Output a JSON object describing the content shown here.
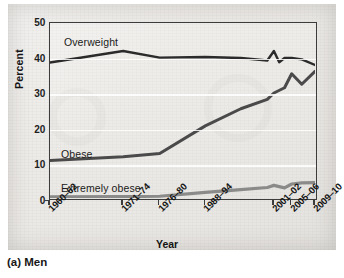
{
  "caption": "(a) Men",
  "chart_data": {
    "type": "line",
    "title": "",
    "xlabel": "Year",
    "ylabel": "Percent",
    "ylim": [
      0,
      50
    ],
    "yticks": [
      0,
      10,
      20,
      30,
      40,
      50
    ],
    "grid": true,
    "legend_position": "inline-labels",
    "categories": [
      "1960-62",
      "1971-74",
      "1976-80",
      "1988-94",
      "2001-02",
      "2005-06",
      "2009-10"
    ],
    "x_tick_labels": [
      "1960–62",
      "1971–74",
      "1976–80",
      "1988–94",
      "2001–02",
      "2005–06",
      "2009–10"
    ],
    "x_positions": [
      0,
      0.276,
      0.414,
      0.586,
      0.845,
      0.912,
      1.0
    ],
    "series": [
      {
        "name": "Overweight",
        "label": "Overweight",
        "color": "#2b2b2b",
        "x": [
          0,
          0.276,
          0.414,
          0.586,
          0.72,
          0.82,
          0.845,
          0.865,
          0.885,
          0.912,
          0.95,
          1.0
        ],
        "values": [
          38.7,
          42.0,
          40.1,
          40.3,
          40.0,
          39.3,
          42.0,
          38.8,
          40.0,
          40.0,
          39.6,
          38.0
        ]
      },
      {
        "name": "Obese",
        "label": "Obese",
        "color": "#4a4a4a",
        "x": [
          0,
          0.276,
          0.414,
          0.586,
          0.72,
          0.82,
          0.845,
          0.885,
          0.912,
          0.95,
          1.0
        ],
        "values": [
          10.7,
          11.8,
          12.7,
          20.6,
          25.5,
          28.2,
          30.0,
          31.5,
          35.5,
          32.5,
          36.2
        ]
      },
      {
        "name": "Extremely obese",
        "label": "Extremely obese",
        "color": "#7a7a7a",
        "x": [
          0,
          0.276,
          0.414,
          0.586,
          0.72,
          0.82,
          0.845,
          0.885,
          0.912,
          0.95,
          1.0
        ],
        "values": [
          0.3,
          0.4,
          0.5,
          1.6,
          2.4,
          3.0,
          3.6,
          2.9,
          4.0,
          4.3,
          4.4
        ]
      }
    ]
  }
}
